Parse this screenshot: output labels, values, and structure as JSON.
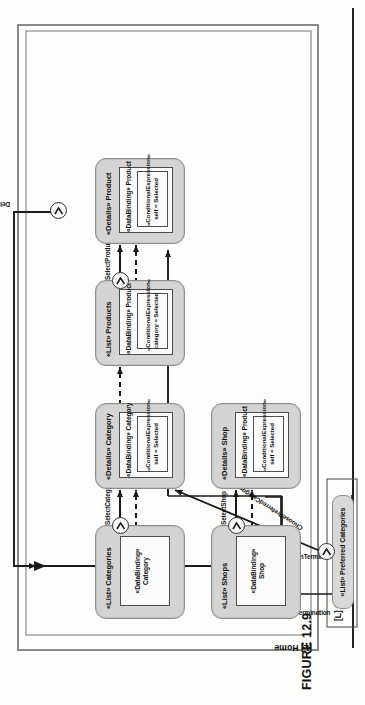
{
  "figure": {
    "caption": "FIGURE 12.9",
    "rotation_degrees": 90
  },
  "containers": {
    "home": {
      "label": "[L] Home"
    },
    "user_profile": {
      "label": "[L] User's profile"
    }
  },
  "action": {
    "name_line1": "Delete",
    "name_line2": "Product",
    "shape": "hexagon",
    "events": [
      {
        "name": "NormalTermination"
      },
      {
        "name": "ExceptionTermination"
      }
    ]
  },
  "view_components": [
    {
      "id": "list-preferred-categories",
      "title": "«List» Preferred Categories",
      "bindings": []
    },
    {
      "id": "list-categories",
      "title": "«List» Categories",
      "bindings": [
        {
          "line1": "«DataBinding»",
          "line2": "Category"
        }
      ]
    },
    {
      "id": "details-category",
      "title": "«Details» Category",
      "bindings": [
        {
          "line1": "«DataBinding» Category",
          "line2": ""
        },
        {
          "line1": "«ConditionalExpression»",
          "line2": "self = Selected"
        }
      ]
    },
    {
      "id": "list-products",
      "title": "«List» Products",
      "bindings": [
        {
          "line1": "«DataBinding» Product",
          "line2": ""
        },
        {
          "line1": "«ConditionalExpression»",
          "line2": "category = Selected"
        }
      ]
    },
    {
      "id": "details-product",
      "title": "«Details» Product",
      "bindings": [
        {
          "line1": "«DataBinding» Product",
          "line2": ""
        },
        {
          "line1": "«ConditionalExpression»",
          "line2": "self = Selected"
        }
      ]
    },
    {
      "id": "list-shops",
      "title": "«List» Shops",
      "bindings": [
        {
          "line1": "«DataBinding»",
          "line2": "Shop"
        }
      ]
    },
    {
      "id": "details-shop",
      "title": "«Details» Shop",
      "bindings": [
        {
          "line1": "«DataBinding» Product",
          "line2": ""
        },
        {
          "line1": "«ConditionalExpression»",
          "line2": "self = Selected"
        }
      ]
    }
  ],
  "edge_labels": {
    "choose_preferred_category": "ChoosePreferredCategory",
    "select_category": "SelectCategory",
    "select_product": "SelectProduct",
    "select_shop": "SelectShop",
    "delete_product": "DeleteProduct",
    "normal_termination": "NormalTermination",
    "exception_termination": "ExceptionTermination"
  },
  "colors": {
    "container_fill": "#d4d4d4",
    "container_stroke": "#8d8d8d",
    "inner_fill": "#fbfbfb",
    "line": "#1e1e1e",
    "page_bg": "#fdfdfc"
  }
}
